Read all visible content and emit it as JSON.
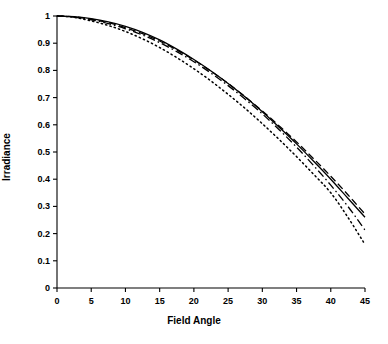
{
  "chart_data": {
    "type": "line",
    "title": "",
    "xlabel": "Field Angle",
    "ylabel": "Irradiance",
    "xlim": [
      0,
      45
    ],
    "ylim": [
      0,
      1
    ],
    "xticks": [
      0,
      5,
      10,
      15,
      20,
      25,
      30,
      35,
      40,
      45
    ],
    "xtick_labels": [
      "0",
      "5",
      "10",
      "15",
      "20",
      "25",
      "30",
      "35",
      "40",
      "45"
    ],
    "yticks": [
      0,
      0.1,
      0.2,
      0.3,
      0.4,
      0.5,
      0.6,
      0.7,
      0.8,
      0.9,
      1
    ],
    "ytick_labels": [
      "0",
      "0.1",
      "0.2",
      "0.3",
      "0.4",
      "0.5",
      "0.6",
      "0.7",
      "0.8",
      "0.9",
      "1"
    ],
    "grid": false,
    "legend": null,
    "legend_position": "none",
    "line_color": "#000000",
    "background_color": "#ffffff",
    "axis_color": "#000000",
    "x": [
      0,
      2.5,
      5,
      7.5,
      10,
      12.5,
      15,
      17.5,
      20,
      22.5,
      25,
      27.5,
      30,
      32.5,
      35,
      37.5,
      40,
      42.5,
      45
    ],
    "series": [
      {
        "name": "curve-solid",
        "style": "solid",
        "dasharray": "",
        "values": [
          1.0,
          0.998,
          0.99,
          0.978,
          0.962,
          0.94,
          0.912,
          0.878,
          0.84,
          0.798,
          0.752,
          0.702,
          0.648,
          0.59,
          0.53,
          0.466,
          0.4,
          0.33,
          0.26
        ]
      },
      {
        "name": "curve-dashed",
        "style": "dashed",
        "dasharray": "7,3.5",
        "values": [
          1.0,
          0.997,
          0.988,
          0.975,
          0.957,
          0.935,
          0.908,
          0.875,
          0.838,
          0.797,
          0.752,
          0.703,
          0.651,
          0.595,
          0.537,
          0.475,
          0.411,
          0.343,
          0.272
        ]
      },
      {
        "name": "curve-dash-dot",
        "style": "dashdot",
        "dasharray": "8,3,1.6,3",
        "values": [
          1.0,
          0.996,
          0.986,
          0.972,
          0.953,
          0.93,
          0.902,
          0.869,
          0.832,
          0.79,
          0.744,
          0.694,
          0.64,
          0.581,
          0.518,
          0.45,
          0.378,
          0.3,
          0.213
        ]
      },
      {
        "name": "curve-dotted",
        "style": "dotted",
        "dasharray": "1.3,3.2",
        "values": [
          1.0,
          0.995,
          0.982,
          0.965,
          0.943,
          0.916,
          0.884,
          0.847,
          0.806,
          0.761,
          0.712,
          0.66,
          0.604,
          0.545,
          0.483,
          0.418,
          0.35,
          0.26,
          0.16
        ]
      }
    ]
  }
}
